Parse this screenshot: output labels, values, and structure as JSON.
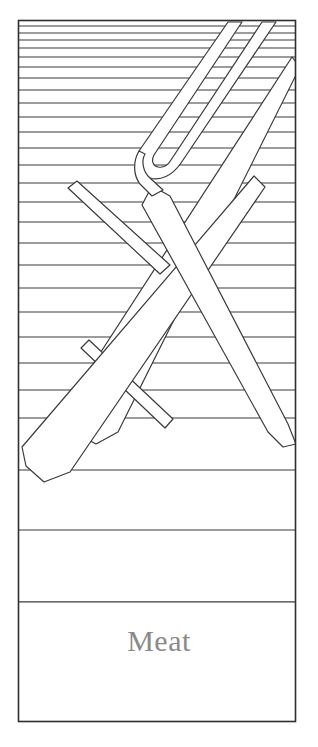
{
  "card": {
    "caption": "Meat",
    "caption_color": "#8a8a8a",
    "background_color": "#ffffff",
    "line_color": "#3a3a3a",
    "border_color": "#2e2e2e",
    "frame": {
      "x": 18,
      "y": 20,
      "width": 278,
      "height": 702
    },
    "caption_band": {
      "y": 602,
      "height": 120
    }
  },
  "icons": {
    "fork": "fork-icon",
    "knife_upper": "sword-knife-upper-icon",
    "knife_lower": "sword-knife-lower-icon",
    "hatching": "horizontal-rule-hatching"
  },
  "chart_data": {
    "type": "line",
    "title": "Meat",
    "xlabel": "",
    "ylabel": "",
    "grid": true,
    "legend": "none",
    "axis_ranges": {
      "x": [
        18,
        296
      ],
      "y": [
        20,
        722
      ]
    },
    "categories": [
      "rule-01",
      "rule-02",
      "rule-03",
      "rule-04",
      "rule-05",
      "rule-06",
      "rule-07",
      "rule-08",
      "rule-09",
      "rule-10",
      "rule-11",
      "rule-12",
      "rule-13",
      "rule-14",
      "rule-15",
      "rule-16",
      "rule-17",
      "rule-18",
      "rule-19",
      "rule-20",
      "rule-21",
      "rule-22",
      "rule-23",
      "rule-24",
      "rule-25",
      "rule-26",
      "rule-27"
    ],
    "values": [
      26,
      33,
      40,
      48,
      57,
      67,
      78,
      90,
      103,
      117,
      132,
      148,
      165,
      183,
      202,
      222,
      243,
      265,
      288,
      312,
      337,
      363,
      390,
      418,
      470,
      530,
      602
    ],
    "series": [
      {
        "name": "horizontal-rules-y",
        "values": [
          26,
          33,
          40,
          48,
          57,
          67,
          78,
          90,
          103,
          117,
          132,
          148,
          165,
          183,
          202,
          222,
          243,
          265,
          288,
          312,
          337,
          363,
          390,
          418,
          470,
          530,
          602
        ]
      }
    ]
  }
}
